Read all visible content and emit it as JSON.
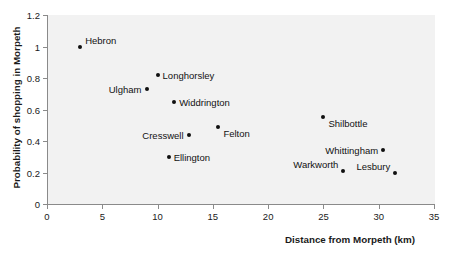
{
  "chart_data": {
    "type": "scatter",
    "title": "",
    "xlabel": "Distance from Morpeth (km)",
    "ylabel": "Probability of shopping in Morpeth",
    "xlim": [
      0,
      35
    ],
    "ylim": [
      0,
      1.2
    ],
    "xticks": [
      "0",
      "5",
      "10",
      "15",
      "20",
      "25",
      "30",
      "35"
    ],
    "xtick_values": [
      0,
      5,
      10,
      15,
      20,
      25,
      30,
      35
    ],
    "yticks": [
      "0",
      "0.2",
      "0.4",
      "0.6",
      "0.8",
      "1",
      "1.2"
    ],
    "ytick_values": [
      0,
      0.2,
      0.4,
      0.6,
      0.8,
      1.0,
      1.2
    ],
    "grid": false,
    "legend": "none",
    "marker_color": "#101010",
    "plot_background": "#f2f2f2",
    "axis_color": "#8a8a8a",
    "points": [
      {
        "label": "Hebron",
        "x": 3.0,
        "y": 1.0,
        "label_pos": "above-right"
      },
      {
        "label": "Longhorsley",
        "x": 10.0,
        "y": 0.82,
        "label_pos": "right"
      },
      {
        "label": "Ulgham",
        "x": 9.0,
        "y": 0.73,
        "label_pos": "left"
      },
      {
        "label": "Widdrington",
        "x": 11.5,
        "y": 0.65,
        "label_pos": "right"
      },
      {
        "label": "Felton",
        "x": 15.5,
        "y": 0.49,
        "label_pos": "below-right"
      },
      {
        "label": "Cresswell",
        "x": 12.8,
        "y": 0.44,
        "label_pos": "left"
      },
      {
        "label": "Shilbottle",
        "x": 25.0,
        "y": 0.55,
        "label_pos": "below-right"
      },
      {
        "label": "Whittingham",
        "x": 30.4,
        "y": 0.34,
        "label_pos": "left"
      },
      {
        "label": "Ellington",
        "x": 11.0,
        "y": 0.3,
        "label_pos": "right"
      },
      {
        "label": "Warkworth",
        "x": 26.8,
        "y": 0.21,
        "label_pos": "above-left"
      },
      {
        "label": "Lesbury",
        "x": 31.5,
        "y": 0.195,
        "label_pos": "above-left"
      }
    ]
  }
}
